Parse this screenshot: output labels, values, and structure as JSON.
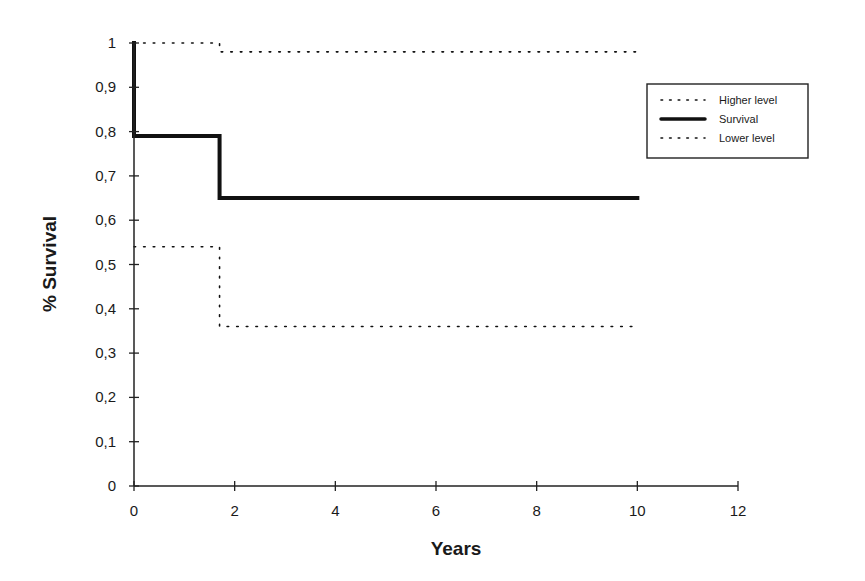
{
  "chart_data": {
    "type": "line",
    "subtype": "kaplan-meier step",
    "title": "",
    "xlabel": "Years",
    "ylabel": "% Survival",
    "xlim": [
      0,
      12
    ],
    "ylim": [
      0,
      1
    ],
    "x_ticks": [
      0,
      2,
      4,
      6,
      8,
      10,
      12
    ],
    "x_tick_labels": [
      "0",
      "2",
      "4",
      "6",
      "8",
      "10",
      "12"
    ],
    "y_ticks": [
      0,
      0.1,
      0.2,
      0.3,
      0.4,
      0.5,
      0.6,
      0.7,
      0.8,
      0.9,
      1
    ],
    "y_tick_labels": [
      "0",
      "0,1",
      "0,2",
      "0,3",
      "0,4",
      "0,5",
      "0,6",
      "0,7",
      "0,8",
      "0,9",
      "1"
    ],
    "grid": false,
    "legend_position": "upper right",
    "series": [
      {
        "name": "Higher level",
        "style": "dotted",
        "x": [
          0,
          1.7,
          1.7,
          10
        ],
        "y": [
          1.0,
          1.0,
          0.98,
          0.98
        ]
      },
      {
        "name": "Survival",
        "style": "solid-thick",
        "x": [
          0,
          0,
          1.7,
          1.7,
          10
        ],
        "y": [
          1.0,
          0.79,
          0.79,
          0.65,
          0.65
        ]
      },
      {
        "name": "Lower level",
        "style": "dotted",
        "x": [
          0,
          1.7,
          1.7,
          10
        ],
        "y": [
          0.54,
          0.54,
          0.36,
          0.36
        ]
      }
    ]
  }
}
